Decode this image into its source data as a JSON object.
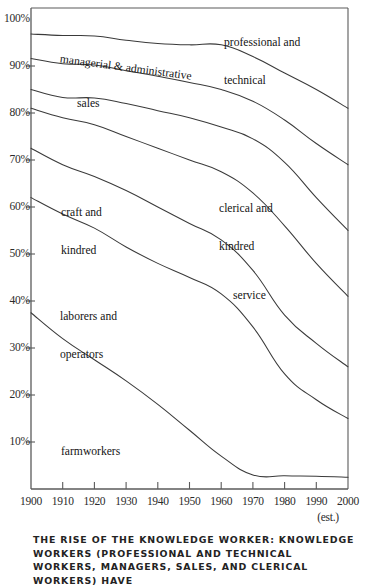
{
  "caption": {
    "text": "The Rise of the Knowledge worker: Knowledge workers (professional and technical workers, managers, sales, and clerical workers) have"
  },
  "axes": {
    "y_ticks": [
      "100%",
      "90%",
      "80%",
      "70%",
      "60%",
      "50%",
      "40%",
      "30%",
      "20%",
      "10%"
    ],
    "y_values": [
      100,
      90,
      80,
      70,
      60,
      50,
      40,
      30,
      20,
      10
    ],
    "x_ticks": [
      "1900",
      "1910",
      "1920",
      "1930",
      "1940",
      "1950",
      "1960",
      "1970",
      "1980",
      "1990",
      "2000"
    ],
    "x_values": [
      1900,
      1910,
      1920,
      1930,
      1940,
      1950,
      1960,
      1970,
      1980,
      1990,
      2000
    ],
    "x_note": "(est.)"
  },
  "series_labels": [
    {
      "id": "professional-and-technical",
      "line1": "professional and",
      "line2": "technical"
    },
    {
      "id": "managerial-and-administrative",
      "line1": "managerial &",
      "line2": "administrative"
    },
    {
      "id": "sales",
      "line1": "sales",
      "line2": ""
    },
    {
      "id": "clerical-and-kindred",
      "line1": "clerical and",
      "line2": "kindred"
    },
    {
      "id": "craft-and-kindred",
      "line1": "craft and",
      "line2": "kindred"
    },
    {
      "id": "service",
      "line1": "service",
      "line2": ""
    },
    {
      "id": "laborers-and-operators",
      "line1": "laborers and",
      "line2": "operators"
    },
    {
      "id": "farmworkers",
      "line1": "farmworkers",
      "line2": ""
    }
  ],
  "colors": {
    "line": "#3a3a3a",
    "axis": "#5a5a5a",
    "text": "#1a1a1a",
    "background": "#ffffff"
  },
  "chart_data": {
    "type": "area",
    "title": "The Rise of the Knowledge worker",
    "xlabel": "",
    "ylabel": "",
    "xlim": [
      1900,
      2000
    ],
    "ylim": [
      0,
      100
    ],
    "grid": false,
    "legend": "in-plot labels",
    "stacked": true,
    "note": "Cumulative stacked percentage of the U.S. workforce; boundaries are cumulative totals read from top of chart downward.",
    "x": [
      1900,
      1910,
      1920,
      1930,
      1940,
      1950,
      1960,
      1970,
      1980,
      1990,
      2000
    ],
    "cumulative_boundaries": [
      {
        "name": "top of managerial & administrative",
        "values": [
          96.8,
          96.5,
          96.4,
          95.5,
          94.8,
          94.5,
          94.5,
          92.0,
          88.5,
          85.0,
          81.0
        ]
      },
      {
        "name": "top of sales",
        "values": [
          91.6,
          90.5,
          90.2,
          89.0,
          87.8,
          86.5,
          85.0,
          82.5,
          78.5,
          73.5,
          69.0
        ]
      },
      {
        "name": "top of clerical and kindred",
        "values": [
          85.0,
          83.3,
          83.2,
          82.0,
          80.5,
          79.0,
          77.0,
          74.5,
          69.5,
          62.0,
          55.0
        ]
      },
      {
        "name": "top of craft and kindred",
        "values": [
          81.0,
          79.0,
          77.5,
          75.0,
          72.5,
          70.0,
          67.5,
          63.0,
          56.0,
          48.0,
          41.0
        ]
      },
      {
        "name": "top of service",
        "values": [
          72.5,
          69.0,
          66.5,
          63.5,
          60.0,
          56.5,
          53.0,
          46.5,
          37.0,
          31.0,
          26.0
        ]
      },
      {
        "name": "top of laborers and operators",
        "values": [
          62.0,
          58.5,
          55.5,
          51.5,
          48.0,
          45.0,
          41.5,
          34.5,
          24.5,
          19.0,
          15.0
        ]
      },
      {
        "name": "top of farmworkers",
        "values": [
          37.5,
          32.0,
          27.5,
          23.0,
          18.0,
          12.5,
          7.0,
          3.0,
          2.8,
          2.7,
          2.5
        ]
      }
    ],
    "series": [
      {
        "name": "professional and technical",
        "values": [
          3.2,
          3.5,
          3.6,
          4.5,
          5.2,
          5.5,
          5.5,
          8.0,
          11.5,
          15.0,
          19.0
        ]
      },
      {
        "name": "managerial and administrative",
        "values": [
          5.2,
          6.0,
          6.2,
          6.5,
          7.0,
          8.0,
          9.5,
          9.5,
          10.0,
          11.5,
          12.0
        ]
      },
      {
        "name": "sales",
        "values": [
          6.6,
          7.2,
          7.0,
          7.0,
          7.3,
          7.5,
          8.0,
          8.0,
          9.0,
          11.5,
          14.0
        ]
      },
      {
        "name": "clerical and kindred",
        "values": [
          4.0,
          4.3,
          5.7,
          7.0,
          8.0,
          9.0,
          9.5,
          11.5,
          13.5,
          14.0,
          14.0
        ]
      },
      {
        "name": "craft and kindred",
        "values": [
          8.5,
          10.0,
          11.0,
          11.5,
          12.5,
          13.5,
          14.5,
          16.5,
          19.0,
          17.0,
          15.0
        ]
      },
      {
        "name": "service",
        "values": [
          10.5,
          10.5,
          11.0,
          12.0,
          12.0,
          11.5,
          11.5,
          12.0,
          12.5,
          12.0,
          11.0
        ]
      },
      {
        "name": "laborers and operators",
        "values": [
          24.5,
          26.5,
          28.0,
          28.5,
          30.0,
          32.5,
          34.5,
          31.5,
          21.7,
          16.3,
          12.5
        ]
      },
      {
        "name": "farmworkers",
        "values": [
          37.5,
          32.0,
          27.5,
          23.0,
          18.0,
          12.5,
          7.0,
          3.0,
          2.8,
          2.7,
          2.5
        ]
      }
    ]
  }
}
